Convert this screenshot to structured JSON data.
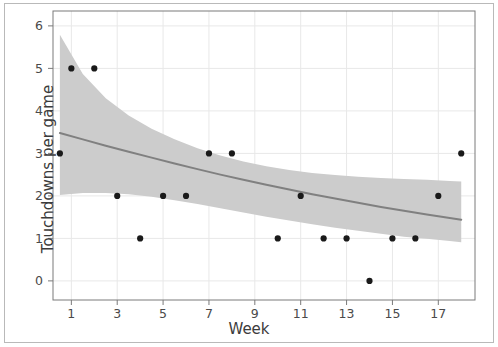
{
  "chart_data": {
    "type": "scatter",
    "title": "",
    "subtitle": "",
    "xlabel": "Week",
    "ylabel": "Touchdowns per game",
    "xlim": [
      0.2,
      18.6
    ],
    "ylim": [
      -0.45,
      6.35
    ],
    "xticks": [
      1,
      3,
      5,
      7,
      9,
      11,
      13,
      15,
      17
    ],
    "yticks": [
      0,
      1,
      2,
      3,
      4,
      5,
      6
    ],
    "xtick_labels": [
      "1",
      "3",
      "5",
      "7",
      "9",
      "11",
      "13",
      "15",
      "17"
    ],
    "ytick_labels": [
      "0",
      "1",
      "2",
      "3",
      "4",
      "5",
      "6"
    ],
    "grid": true,
    "legend": "none",
    "points": [
      {
        "x": 0.5,
        "y": 3
      },
      {
        "x": 1,
        "y": 5
      },
      {
        "x": 2,
        "y": 5
      },
      {
        "x": 3,
        "y": 2
      },
      {
        "x": 4,
        "y": 1
      },
      {
        "x": 5,
        "y": 2
      },
      {
        "x": 6,
        "y": 2
      },
      {
        "x": 7,
        "y": 3
      },
      {
        "x": 8,
        "y": 3
      },
      {
        "x": 10,
        "y": 1
      },
      {
        "x": 11,
        "y": 2
      },
      {
        "x": 12,
        "y": 1
      },
      {
        "x": 13,
        "y": 1
      },
      {
        "x": 14,
        "y": 0
      },
      {
        "x": 15,
        "y": 1
      },
      {
        "x": 16,
        "y": 1
      },
      {
        "x": 17,
        "y": 2
      },
      {
        "x": 18,
        "y": 3
      }
    ],
    "series": [
      {
        "name": "fitted regression line",
        "type": "line",
        "color": "#808080",
        "x": [
          0.5,
          1.5,
          2.5,
          3.5,
          4.5,
          5.5,
          6.5,
          7.5,
          8.5,
          9.5,
          10.5,
          11.5,
          12.5,
          13.5,
          14.5,
          15.5,
          16.5,
          17.5,
          18.0
        ],
        "values": [
          3.48,
          3.33,
          3.18,
          3.04,
          2.9,
          2.76,
          2.63,
          2.5,
          2.38,
          2.26,
          2.15,
          2.04,
          1.94,
          1.84,
          1.74,
          1.65,
          1.56,
          1.48,
          1.44
        ]
      }
    ],
    "confidence_band": {
      "name": "confidence interval",
      "color": "#cccccc",
      "opacity": 1,
      "x": [
        0.5,
        1.5,
        2.5,
        3.5,
        4.5,
        5.5,
        6.5,
        7.5,
        8.5,
        9.5,
        10.5,
        11.5,
        12.5,
        13.5,
        14.5,
        15.5,
        16.5,
        17.5,
        18.0
      ],
      "upper": [
        5.79,
        4.87,
        4.3,
        3.89,
        3.58,
        3.33,
        3.12,
        2.95,
        2.81,
        2.7,
        2.61,
        2.54,
        2.49,
        2.45,
        2.42,
        2.4,
        2.38,
        2.35,
        2.34
      ],
      "lower": [
        2.02,
        2.07,
        2.07,
        2.04,
        1.98,
        1.9,
        1.81,
        1.71,
        1.61,
        1.51,
        1.42,
        1.33,
        1.25,
        1.18,
        1.11,
        1.04,
        0.99,
        0.94,
        0.91
      ]
    },
    "colors": {
      "point": "#1a1a1a",
      "line": "#808080",
      "band": "#cccccc",
      "grid": "#e8e8e8",
      "axis": "#7a7a7a",
      "text": "#3b3b3b",
      "frame": "#b9b9b9",
      "background": "#ffffff"
    }
  }
}
